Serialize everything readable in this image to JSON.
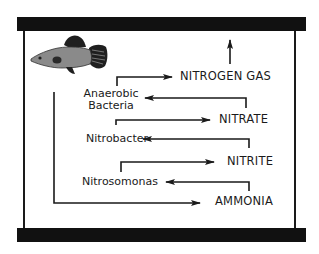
{
  "diagram": {
    "type": "nitrogen-cycle-aquarium",
    "colors": {
      "line": "#1a1a1a",
      "tank_bar": "#111111",
      "fish_body": "#8a8a8a",
      "fish_fins": "#1f1f1f",
      "background": "#ffffff"
    },
    "compounds": {
      "nitrogen_gas": "NITROGEN GAS",
      "nitrate": "NITRATE",
      "nitrite": "NITRITE",
      "ammonia": "AMMONIA"
    },
    "bacteria": {
      "anaerobic_line1": "Anaerobic",
      "anaerobic_line2": "Bacteria",
      "nitrobacter": "Nitrobacter",
      "nitrosomonas": "Nitrosomonas"
    },
    "flow": [
      {
        "from": "fish",
        "to": "AMMONIA"
      },
      {
        "from": "AMMONIA",
        "to": "Nitrosomonas"
      },
      {
        "from": "Nitrosomonas",
        "to": "NITRITE"
      },
      {
        "from": "NITRITE",
        "to": "Nitrobacter"
      },
      {
        "from": "Nitrobacter",
        "to": "NITRATE"
      },
      {
        "from": "NITRATE",
        "to": "Anaerobic Bacteria"
      },
      {
        "from": "Anaerobic Bacteria",
        "to": "NITROGEN GAS"
      },
      {
        "from": "NITROGEN GAS",
        "to": "atmosphere (up)"
      }
    ]
  }
}
